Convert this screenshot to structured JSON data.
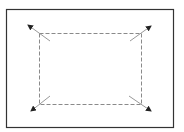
{
  "diagram": {
    "type": "expand-selection-icon",
    "frame": {
      "x": 6,
      "y": 9,
      "width": 167,
      "height": 118,
      "stroke": "#333333",
      "stroke_width": 1.2
    },
    "selection": {
      "x": 39,
      "y": 33,
      "width": 102,
      "height": 71,
      "stroke": "#8a8a8a",
      "dash": "4,2"
    },
    "arrows": [
      {
        "name": "top-left",
        "x1": 50,
        "y1": 41,
        "x2": 28,
        "y2": 25
      },
      {
        "name": "top-right",
        "x1": 130,
        "y1": 41,
        "x2": 151,
        "y2": 26
      },
      {
        "name": "bottom-left",
        "x1": 50,
        "y1": 96,
        "x2": 31,
        "y2": 111
      },
      {
        "name": "bottom-right",
        "x1": 129,
        "y1": 96,
        "x2": 151,
        "y2": 111
      }
    ],
    "colors": {
      "arrow_shaft": "#999999",
      "arrow_head": "#222222",
      "background": "#ffffff"
    }
  }
}
